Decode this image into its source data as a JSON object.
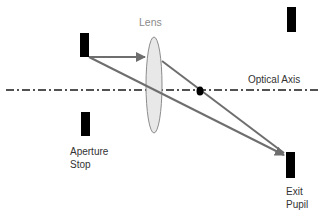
{
  "diagram": {
    "labels": {
      "lens": "Lens",
      "optical_axis": "Optical Axis",
      "aperture_stop_line1": "Aperture",
      "aperture_stop_line2": "Stop",
      "exit_pupil_line1": "Exit",
      "exit_pupil_line2": "Pupil"
    },
    "colors": {
      "stop_block": "#000000",
      "ray": "#6e6e6e",
      "lens_fill": "#e8e8e8",
      "lens_stroke": "#8c8c8c",
      "axis": "#1a1a1a",
      "focal_point": "#000000"
    }
  }
}
